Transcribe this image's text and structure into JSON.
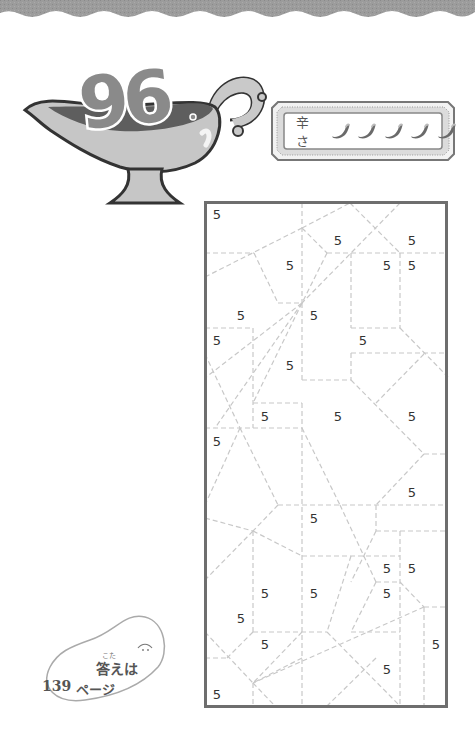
{
  "puzzle": {
    "number": "96",
    "spice_label": "辛さ",
    "spice_level": 5,
    "spice_icons": [
      "chili-pepper-icon",
      "chili-pepper-icon",
      "chili-pepper-icon",
      "chili-pepper-icon",
      "chili-pepper-icon"
    ],
    "frame": {
      "x": 205,
      "y": 202,
      "width": 243,
      "height": 506
    },
    "clues": [
      {
        "value": "5",
        "x": 217,
        "y": 215
      },
      {
        "value": "5",
        "x": 338,
        "y": 241
      },
      {
        "value": "5",
        "x": 412,
        "y": 241
      },
      {
        "value": "5",
        "x": 290,
        "y": 266
      },
      {
        "value": "5",
        "x": 387,
        "y": 266
      },
      {
        "value": "5",
        "x": 412,
        "y": 266
      },
      {
        "value": "5",
        "x": 241,
        "y": 316
      },
      {
        "value": "5",
        "x": 314,
        "y": 316
      },
      {
        "value": "5",
        "x": 217,
        "y": 341
      },
      {
        "value": "5",
        "x": 363,
        "y": 341
      },
      {
        "value": "5",
        "x": 290,
        "y": 366
      },
      {
        "value": "5",
        "x": 265,
        "y": 417
      },
      {
        "value": "5",
        "x": 338,
        "y": 417
      },
      {
        "value": "5",
        "x": 412,
        "y": 417
      },
      {
        "value": "5",
        "x": 217,
        "y": 442
      },
      {
        "value": "5",
        "x": 412,
        "y": 493
      },
      {
        "value": "5",
        "x": 314,
        "y": 519
      },
      {
        "value": "5",
        "x": 387,
        "y": 569
      },
      {
        "value": "5",
        "x": 412,
        "y": 569
      },
      {
        "value": "5",
        "x": 265,
        "y": 594
      },
      {
        "value": "5",
        "x": 314,
        "y": 594
      },
      {
        "value": "5",
        "x": 387,
        "y": 594
      },
      {
        "value": "5",
        "x": 241,
        "y": 619
      },
      {
        "value": "5",
        "x": 265,
        "y": 645
      },
      {
        "value": "5",
        "x": 436,
        "y": 645
      },
      {
        "value": "5",
        "x": 387,
        "y": 670
      },
      {
        "value": "5",
        "x": 217,
        "y": 695
      }
    ],
    "colors": {
      "frame": "#6e6e6e",
      "dashed_line": "#c8c8c8",
      "clue_text": "#333333",
      "badge_number": "#8a8a8a",
      "top_band": "#9a9a9a"
    }
  },
  "answer_note": {
    "ruby": "こた",
    "line1": "答えは",
    "page_number": "139",
    "page_suffix": "ページ"
  }
}
